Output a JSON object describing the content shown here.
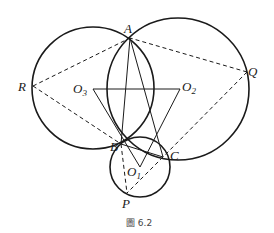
{
  "figure": {
    "caption": "圖 6.2",
    "stroke_color": "#1a1a1a"
  },
  "points": {
    "A": {
      "label": "A",
      "x": 130,
      "y": 38
    },
    "B": {
      "label": "B",
      "x": 121,
      "y": 144
    },
    "C": {
      "label": "C",
      "x": 163,
      "y": 157
    },
    "P": {
      "label": "P",
      "x": 127,
      "y": 193
    },
    "Q": {
      "label": "Q",
      "x": 247,
      "y": 72
    },
    "R": {
      "label": "R",
      "x": 33,
      "y": 86
    },
    "O1": {
      "label": "O",
      "sub": "1",
      "x": 140,
      "y": 167
    },
    "O2": {
      "label": "O",
      "sub": "2",
      "x": 180,
      "y": 89
    },
    "O3": {
      "label": "O",
      "sub": "3",
      "x": 93,
      "y": 89
    }
  },
  "circles": [
    {
      "name": "circle-O3",
      "cx": 93,
      "cy": 88,
      "r": 61
    },
    {
      "name": "circle-O2",
      "cx": 178,
      "cy": 89,
      "r": 71
    },
    {
      "name": "circle-O1",
      "cx": 140,
      "cy": 167,
      "r": 30
    }
  ],
  "solid_segments": [
    [
      "A",
      "B"
    ],
    [
      "A",
      "C"
    ],
    [
      "B",
      "C"
    ],
    [
      "O3",
      "O2"
    ],
    [
      "O3",
      "O1"
    ],
    [
      "O2",
      "O1"
    ]
  ],
  "dashed_segments": [
    [
      "R",
      "A"
    ],
    [
      "R",
      "B"
    ],
    [
      "Q",
      "A"
    ],
    [
      "Q",
      "C"
    ],
    [
      "B",
      "P"
    ],
    [
      "C",
      "P"
    ]
  ]
}
